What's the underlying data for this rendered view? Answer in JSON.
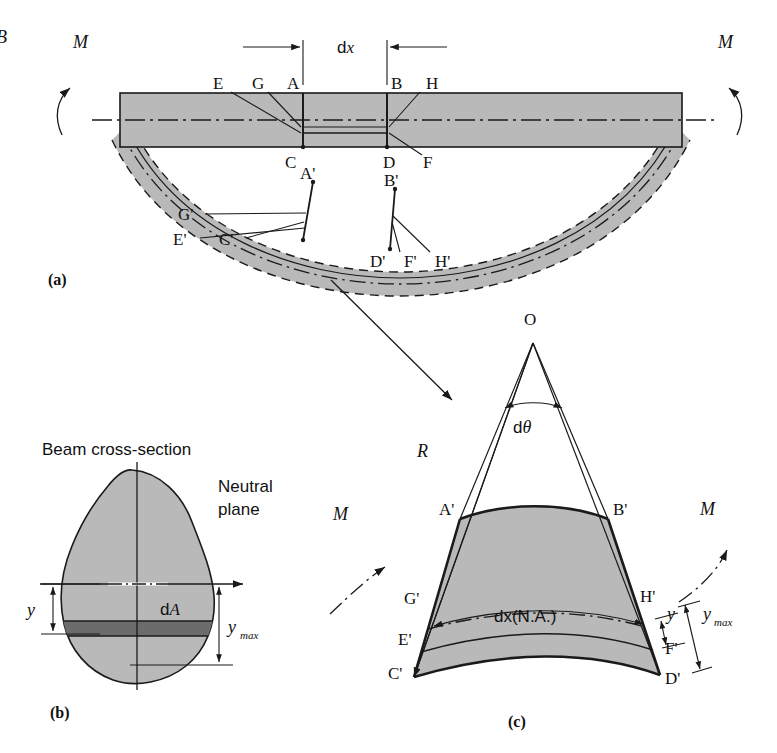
{
  "figure": {
    "title_hidden": "Beam bending / flexure formula derivation",
    "colors": {
      "fill_gray": "#b9b9b9",
      "fill_dark_gray": "#6c6c6c",
      "stroke": "#1a1a1a",
      "background": "#ffffff"
    }
  },
  "panel_a": {
    "caption": "(a)",
    "moment_left": "M",
    "moment_right": "M",
    "dimension_label": "d",
    "dimension_label_italic": "x",
    "edge_fragment": "B",
    "points_top": [
      {
        "id": "E",
        "label": "E"
      },
      {
        "id": "G",
        "label": "G"
      },
      {
        "id": "A",
        "label": "A"
      },
      {
        "id": "B",
        "label": "B"
      },
      {
        "id": "H",
        "label": "H"
      }
    ],
    "points_bottom": [
      {
        "id": "C",
        "label": "C"
      },
      {
        "id": "D",
        "label": "D"
      },
      {
        "id": "F",
        "label": "F"
      }
    ],
    "points_deformed_upper": [
      {
        "id": "Aprime",
        "label": "A'"
      },
      {
        "id": "Bprime",
        "label": "B'"
      }
    ],
    "points_deformed_lower": [
      {
        "id": "Gprime",
        "label": "G'"
      },
      {
        "id": "Eprime",
        "label": "E'"
      },
      {
        "id": "Cprime",
        "label": "C'"
      },
      {
        "id": "Dprime",
        "label": "D'"
      },
      {
        "id": "Fprime",
        "label": "F'"
      },
      {
        "id": "Hprime",
        "label": "H'"
      }
    ]
  },
  "panel_b": {
    "caption": "(b)",
    "title": "Beam cross-section",
    "neutral_plane_label_line1": "Neutral",
    "neutral_plane_label_line2": "plane",
    "y_label": "y",
    "dA_label_d": "d",
    "dA_label_A": "A",
    "ymax_label": "y",
    "ymax_sub": "max"
  },
  "panel_c": {
    "caption": "(c)",
    "origin_label": "O",
    "radius_label": "R",
    "dtheta_label_d": "d",
    "dtheta_label_theta": "θ",
    "moment_left": "M",
    "moment_right": "M",
    "na_label": "dx(N.A.)",
    "y_label": "y",
    "ymax_label": "y",
    "ymax_sub": "max",
    "points": [
      {
        "id": "Aprime",
        "label": "A'"
      },
      {
        "id": "Bprime",
        "label": "B'"
      },
      {
        "id": "Gprime",
        "label": "G'"
      },
      {
        "id": "Hprime",
        "label": "H'"
      },
      {
        "id": "Eprime",
        "label": "E'"
      },
      {
        "id": "Fprime",
        "label": "F'"
      },
      {
        "id": "Cprime",
        "label": "C'"
      },
      {
        "id": "Dprime",
        "label": "D'"
      }
    ]
  }
}
